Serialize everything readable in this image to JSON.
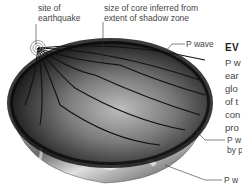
{
  "labels": {
    "earthquake_site": [
      "site of",
      "earthquake"
    ],
    "core_size": [
      "size of core inferred from",
      "extent of shadow zone"
    ],
    "p_wave": "P wave",
    "p_wave_refracted": [
      "P w",
      "by p"
    ],
    "p_wave_bottom": "P w"
  },
  "side_text": {
    "heading": "EV",
    "lines": [
      "P w",
      "ear",
      "glo",
      "of t",
      "con",
      "pro"
    ]
  },
  "colors": {
    "background": "#ffffff",
    "wave_lines": "#111111",
    "label_text": "#444444"
  }
}
